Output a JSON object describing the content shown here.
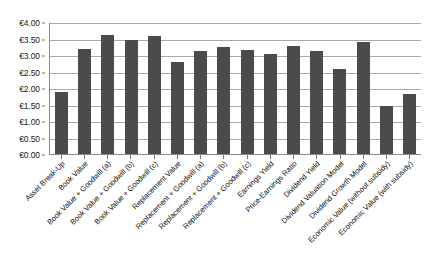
{
  "chart_data": {
    "type": "bar",
    "title": "",
    "xlabel": "",
    "ylabel": "",
    "ylim": [
      0,
      4
    ],
    "grid": true,
    "legend": "none",
    "currency_symbol": "€",
    "bar_color": "#4b4b4b",
    "gridline_color": "#a9a9a9",
    "axis_color": "#8a8a8a",
    "ytick_labels": [
      "€4.00",
      "€3.50",
      "€3.00",
      "€2.50",
      "€2.00",
      "€1.50",
      "€1.00",
      "€0.50",
      "€0.00"
    ],
    "ytick_values": [
      4.0,
      3.5,
      3.0,
      2.5,
      2.0,
      1.5,
      1.0,
      0.5,
      0.0
    ],
    "categories": [
      "Asset Break-Up",
      "Book Value",
      "Book Value + Goodwill (a)",
      "Book Value + Goodwill (b)",
      "Book Value + Goodwill (c)",
      "Replacement Value",
      "Replacement + Goodwill (a)",
      "Replacement + Goodwill (b)",
      "Replacement + Goodwill (c)",
      "Earnings Yield",
      "Price-Earnings Ratio",
      "Dividend Yield",
      "Dividend Valuation Model",
      "Dividend Growth Model",
      "Economic Value (without subsidy)",
      "Economic Value (with subsidy)"
    ],
    "values": [
      1.87,
      3.18,
      3.61,
      3.44,
      3.57,
      2.8,
      3.13,
      3.25,
      3.16,
      3.03,
      3.26,
      3.13,
      2.57,
      3.38,
      1.45,
      1.82
    ]
  }
}
